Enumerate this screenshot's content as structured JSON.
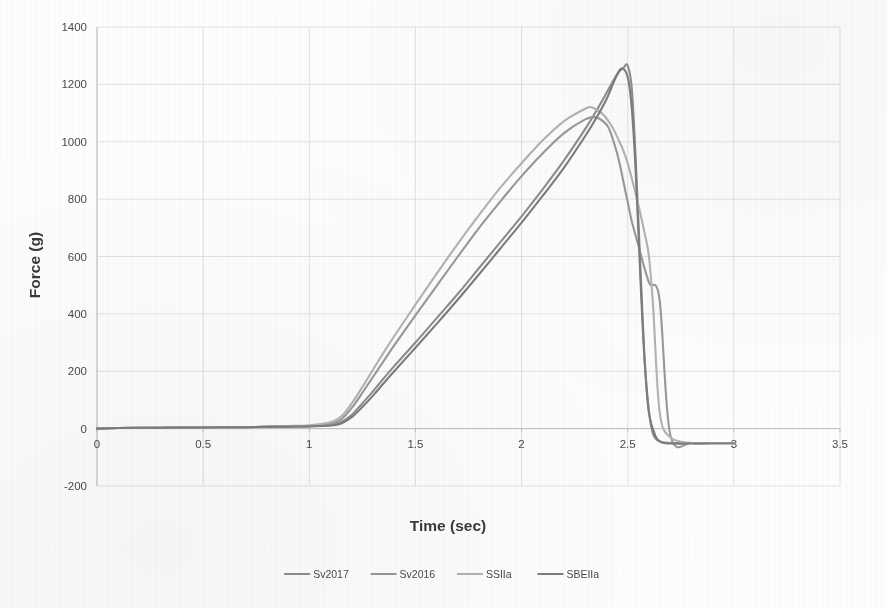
{
  "chart_data": {
    "type": "line",
    "title": "",
    "xlabel": "Time (sec)",
    "ylabel": "Force (g)",
    "xlim": [
      0,
      3.5
    ],
    "ylim": [
      -200,
      1400
    ],
    "xticks": [
      "0",
      "0.5",
      "1",
      "1.5",
      "2",
      "2.5",
      "3",
      "3.5"
    ],
    "xtick_values": [
      0,
      0.5,
      1,
      1.5,
      2,
      2.5,
      3,
      3.5
    ],
    "yticks": [
      "-200",
      "0",
      "200",
      "400",
      "600",
      "800",
      "1000",
      "1200",
      "1400"
    ],
    "ytick_values": [
      -200,
      0,
      200,
      400,
      600,
      800,
      1000,
      1200,
      1400
    ],
    "grid": true,
    "legend_position": "bottom",
    "series": [
      {
        "name": "Sv2017",
        "color": "#8f8f8f",
        "peak_force": 1265,
        "peak_time": 2.5,
        "x": [
          0,
          0.1,
          0.2,
          0.3,
          0.4,
          0.5,
          0.6,
          0.7,
          0.8,
          0.9,
          1.0,
          1.1,
          1.15,
          1.2,
          1.25,
          1.3,
          1.35,
          1.4,
          1.5,
          1.6,
          1.7,
          1.8,
          1.9,
          2.0,
          2.1,
          2.2,
          2.3,
          2.35,
          2.4,
          2.45,
          2.48,
          2.5,
          2.52,
          2.54,
          2.56,
          2.58,
          2.6,
          2.62,
          2.65,
          2.7,
          2.8,
          2.9,
          3.0
        ],
        "y": [
          0,
          2,
          3,
          3,
          4,
          4,
          5,
          5,
          6,
          7,
          8,
          12,
          22,
          48,
          88,
          130,
          175,
          218,
          300,
          385,
          470,
          560,
          650,
          740,
          835,
          935,
          1045,
          1105,
          1170,
          1235,
          1258,
          1265,
          1180,
          900,
          560,
          240,
          60,
          -20,
          -45,
          -50,
          -50,
          -50,
          -50
        ]
      },
      {
        "name": "Sv2016",
        "color": "#9a9a9a",
        "peak_force": 1085,
        "peak_time": 2.35,
        "x": [
          0,
          0.1,
          0.2,
          0.3,
          0.4,
          0.5,
          0.6,
          0.7,
          0.8,
          0.9,
          1.0,
          1.1,
          1.15,
          1.2,
          1.25,
          1.3,
          1.35,
          1.4,
          1.5,
          1.6,
          1.7,
          1.8,
          1.9,
          2.0,
          2.1,
          2.2,
          2.3,
          2.35,
          2.4,
          2.42,
          2.44,
          2.46,
          2.48,
          2.5,
          2.52,
          2.55,
          2.6,
          2.65,
          2.7,
          2.8,
          2.9,
          3.0
        ],
        "y": [
          0,
          2,
          3,
          3,
          4,
          4,
          5,
          5,
          6,
          7,
          9,
          16,
          32,
          72,
          125,
          180,
          235,
          290,
          395,
          498,
          600,
          700,
          792,
          880,
          960,
          1030,
          1078,
          1085,
          1060,
          1030,
          985,
          930,
          860,
          790,
          720,
          640,
          510,
          450,
          -20,
          -50,
          -50,
          -50
        ]
      },
      {
        "name": "SSIIa",
        "color": "#b4b4b4",
        "peak_force": 1120,
        "peak_time": 2.33,
        "x": [
          0,
          0.1,
          0.2,
          0.3,
          0.4,
          0.5,
          0.6,
          0.7,
          0.8,
          0.9,
          1.0,
          1.1,
          1.15,
          1.2,
          1.25,
          1.3,
          1.35,
          1.4,
          1.5,
          1.6,
          1.7,
          1.8,
          1.9,
          2.0,
          2.1,
          2.2,
          2.3,
          2.33,
          2.38,
          2.42,
          2.45,
          2.48,
          2.5,
          2.52,
          2.55,
          2.58,
          2.6,
          2.62,
          2.65,
          2.7,
          2.8,
          2.9,
          3.0
        ],
        "y": [
          0,
          2,
          3,
          3,
          4,
          4,
          5,
          5,
          7,
          9,
          12,
          22,
          42,
          88,
          145,
          205,
          265,
          322,
          432,
          540,
          645,
          745,
          840,
          925,
          1005,
          1072,
          1115,
          1120,
          1098,
          1060,
          1018,
          968,
          925,
          870,
          780,
          680,
          600,
          420,
          60,
          -30,
          -50,
          -50,
          -50
        ]
      },
      {
        "name": "SBEIIa",
        "color": "#7e7e7e",
        "peak_force": 1255,
        "peak_time": 2.47,
        "x": [
          0,
          0.1,
          0.2,
          0.3,
          0.4,
          0.5,
          0.6,
          0.7,
          0.8,
          0.9,
          1.0,
          1.1,
          1.15,
          1.2,
          1.25,
          1.3,
          1.35,
          1.4,
          1.5,
          1.6,
          1.7,
          1.8,
          1.9,
          2.0,
          2.1,
          2.2,
          2.3,
          2.35,
          2.4,
          2.44,
          2.47,
          2.5,
          2.52,
          2.54,
          2.56,
          2.58,
          2.6,
          2.63,
          2.66,
          2.7,
          2.8,
          2.9,
          3.0
        ],
        "y": [
          0,
          2,
          3,
          3,
          4,
          4,
          5,
          5,
          6,
          7,
          8,
          11,
          18,
          40,
          75,
          115,
          158,
          200,
          282,
          365,
          450,
          538,
          628,
          718,
          812,
          910,
          1020,
          1080,
          1148,
          1218,
          1255,
          1225,
          1110,
          860,
          520,
          230,
          55,
          -25,
          -48,
          -52,
          -52,
          -52,
          -52
        ]
      }
    ]
  },
  "legend": {
    "entries": [
      {
        "label": "Sv2017"
      },
      {
        "label": "Sv2016"
      },
      {
        "label": "SSIIa"
      },
      {
        "label": "SBEIIa"
      }
    ]
  }
}
